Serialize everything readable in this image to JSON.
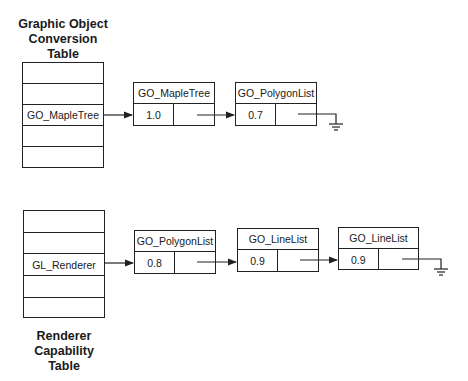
{
  "top": {
    "title_lines": [
      "Graphic Object",
      "Conversion",
      "Table"
    ],
    "table_rows": [
      "",
      "",
      "GO_MapleTree",
      "",
      ""
    ],
    "nodes": [
      {
        "name": "GO_MapleTree",
        "value": "1.0"
      },
      {
        "name": "GO_PolygonList",
        "value": "0.7"
      }
    ]
  },
  "bottom": {
    "title_lines": [
      "Renderer",
      "Capability",
      "Table"
    ],
    "table_rows": [
      "",
      "",
      "GL_Renderer",
      "",
      ""
    ],
    "nodes": [
      {
        "name": "GO_PolygonList",
        "value": "0.8"
      },
      {
        "name": "GO_LineList",
        "value": "0.9"
      },
      {
        "name": "GO_LineList",
        "value": "0.9"
      }
    ]
  },
  "icons": {
    "arrow": "arrow-right-icon",
    "terminator": "ground-null-icon"
  }
}
